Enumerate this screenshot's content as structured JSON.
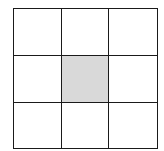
{
  "diagram": {
    "type": "grid",
    "rows": 3,
    "columns": 3,
    "line_color": "#1a1a1a",
    "background_color": "#ffffff",
    "shaded_color": "#d9d9d9",
    "cells": [
      {
        "row": 0,
        "col": 0,
        "shaded": false
      },
      {
        "row": 0,
        "col": 1,
        "shaded": false
      },
      {
        "row": 0,
        "col": 2,
        "shaded": false
      },
      {
        "row": 1,
        "col": 0,
        "shaded": false
      },
      {
        "row": 1,
        "col": 1,
        "shaded": true
      },
      {
        "row": 1,
        "col": 2,
        "shaded": false
      },
      {
        "row": 2,
        "col": 0,
        "shaded": false
      },
      {
        "row": 2,
        "col": 1,
        "shaded": false
      },
      {
        "row": 2,
        "col": 2,
        "shaded": false
      }
    ]
  }
}
